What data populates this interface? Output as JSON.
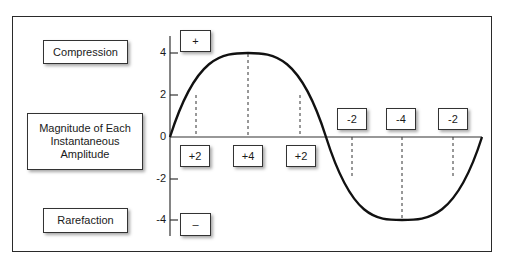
{
  "diagram": {
    "title": "",
    "labels": {
      "compression": "Compression",
      "magnitude": "Magnitude of Each Instantaneous Amplitude",
      "rarefaction": "Rarefaction"
    },
    "polarity": {
      "positive": "+",
      "negative": "–"
    },
    "y_axis": {
      "ticks": [
        "4",
        "2",
        "0",
        "-2",
        "-4"
      ]
    },
    "positive_values": [
      "+2",
      "+4",
      "+2"
    ],
    "negative_values": [
      "-2",
      "-4",
      "-2"
    ],
    "waveform": "sine",
    "colors": {
      "line": "#111111",
      "border": "#333333",
      "background": "#ffffff"
    }
  }
}
